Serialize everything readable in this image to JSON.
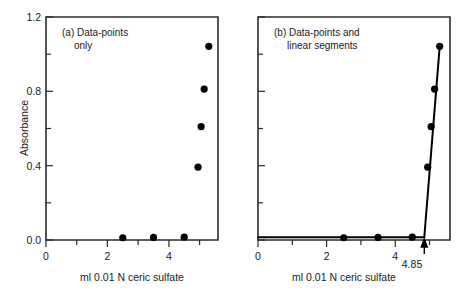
{
  "figure": {
    "ylabel": "Absorbance",
    "xlabel": "ml 0.01 N ceric sulfate"
  },
  "panel_a": {
    "title_line1": "(a) Data-points",
    "title_line2": "only"
  },
  "panel_b": {
    "title_line1": "(b) Data-points and",
    "title_line2": "linear segments",
    "endpoint_label": "4.85"
  },
  "axes": {
    "y_ticklabels": [
      "1.2",
      "0.8",
      "0.4",
      "0.0"
    ],
    "x_ticklabels": [
      "0",
      "2",
      "4"
    ]
  },
  "chart_data": {
    "type": "scatter",
    "xlabel": "ml 0.01 N ceric sulfate",
    "ylabel": "Absorbance",
    "xlim": [
      0,
      5.6
    ],
    "ylim": [
      0.0,
      1.2
    ],
    "y_major_ticks": [
      0.0,
      0.4,
      0.8,
      1.2
    ],
    "y_minor_ticks": [
      0.2,
      0.6,
      1.0
    ],
    "x_major_ticks": [
      0,
      2,
      4
    ],
    "x_minor_ticks": [
      1,
      3,
      5
    ],
    "grid": false,
    "legend": "none",
    "panels": [
      {
        "name": "a",
        "label": "(a) Data-points only",
        "show_segments": false,
        "show_endpoint": false,
        "points": [
          {
            "x": 2.5,
            "y": 0.012
          },
          {
            "x": 3.5,
            "y": 0.014
          },
          {
            "x": 4.5,
            "y": 0.015
          },
          {
            "x": 4.95,
            "y": 0.392
          },
          {
            "x": 5.05,
            "y": 0.61
          },
          {
            "x": 5.15,
            "y": 0.812
          },
          {
            "x": 5.3,
            "y": 1.042
          }
        ]
      },
      {
        "name": "b",
        "label": "(b) Data-points and linear segments",
        "show_segments": true,
        "show_endpoint": true,
        "endpoint_x": 4.85,
        "endpoint_label": "4.85",
        "points": [
          {
            "x": 2.5,
            "y": 0.012
          },
          {
            "x": 3.5,
            "y": 0.014
          },
          {
            "x": 4.5,
            "y": 0.015
          },
          {
            "x": 4.95,
            "y": 0.392
          },
          {
            "x": 5.05,
            "y": 0.61
          },
          {
            "x": 5.15,
            "y": 0.812
          },
          {
            "x": 5.3,
            "y": 1.042
          }
        ],
        "segments": [
          {
            "name": "baseline",
            "from": {
              "x": 0.0,
              "y": 0.015
            },
            "to": {
              "x": 4.85,
              "y": 0.015
            }
          },
          {
            "name": "rising-branch",
            "from": {
              "x": 4.85,
              "y": 0.015
            },
            "to": {
              "x": 5.3,
              "y": 1.042
            }
          }
        ]
      }
    ]
  },
  "colors": {
    "axis": "#2b2b2b",
    "marker": "#000000",
    "line": "#000000",
    "background": "#ffffff"
  }
}
